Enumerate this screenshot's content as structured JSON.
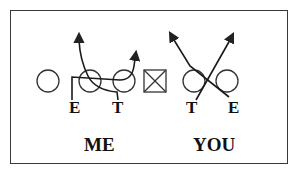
{
  "diagram": {
    "type": "football-blocking-scheme",
    "stroke_color": "#222222",
    "left_side": {
      "label": "ME",
      "players": [
        {
          "id": "E",
          "label": "E"
        },
        {
          "id": "T",
          "label": "T"
        }
      ]
    },
    "right_side": {
      "label": "YOU",
      "players": [
        {
          "id": "T",
          "label": "T"
        },
        {
          "id": "E",
          "label": "E"
        }
      ]
    },
    "center": {
      "symbol": "center-box-with-x"
    },
    "linemen_count": 5
  }
}
